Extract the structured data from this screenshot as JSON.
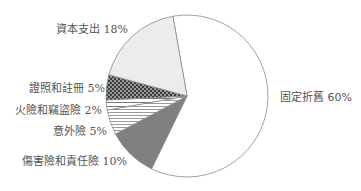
{
  "chart_data": {
    "type": "pie",
    "title": "",
    "categories": [
      "固定折舊",
      "傷害險和責任險",
      "意外險",
      "火險和竊盜險",
      "證照和註冊",
      "資本支出"
    ],
    "values": [
      60,
      10,
      5,
      2,
      5,
      18
    ],
    "unit": "%",
    "labels": [
      "固定折舊 60%",
      "傷害險和責任險 10%",
      "意外險 5%",
      "火險和竊盜險 2%",
      "證照和註冊 5%",
      "資本支出 18%"
    ],
    "fills": [
      "#ffffff",
      "#808080",
      "pattern-lines-dense",
      "pattern-lines-sparse",
      "pattern-checker",
      "#ececec"
    ],
    "start_angle_deg": -10,
    "direction": "clockwise",
    "stroke_color": "#8a8a8a",
    "label_color": "#555555",
    "legend": "none (labels placed beside slices)"
  }
}
